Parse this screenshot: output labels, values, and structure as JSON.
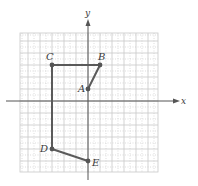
{
  "diagram": {
    "type": "coordinate-plane-polyline",
    "axes": {
      "x_label": "x",
      "y_label": "y"
    },
    "grid": {
      "xmin": -6,
      "xmax": 6,
      "ymin": -6,
      "ymax": 6,
      "minor_step": 0.5
    },
    "points": [
      {
        "label": "A",
        "x": 0,
        "y": 1
      },
      {
        "label": "B",
        "x": 1,
        "y": 3
      },
      {
        "label": "C",
        "x": -3,
        "y": 3
      },
      {
        "label": "D",
        "x": -3,
        "y": -4
      },
      {
        "label": "E",
        "x": 0,
        "y": -5
      }
    ],
    "path_order": [
      "A",
      "B",
      "C",
      "D",
      "E"
    ],
    "colors": {
      "path": "#5a5a5a",
      "grid": "#c8c8c8",
      "axis": "#555555",
      "point": "#555555"
    }
  }
}
